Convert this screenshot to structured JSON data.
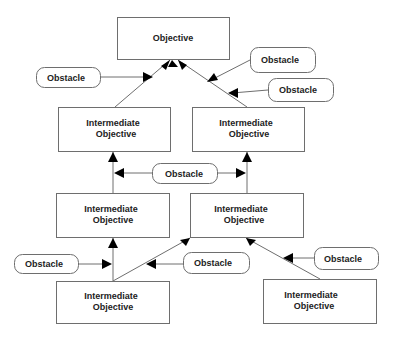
{
  "diagram": {
    "type": "objective-obstacle-tree",
    "colors": {
      "stroke": "#6e6e6e",
      "arrow": "#000000",
      "text": "#222222",
      "background": "#ffffff"
    },
    "nodes": {
      "objective": {
        "label": "Objective"
      },
      "io_r1_left": {
        "line1": "Intermediate",
        "line2": "Objective"
      },
      "io_r1_right": {
        "line1": "Intermediate",
        "line2": "Objective"
      },
      "io_r2_left": {
        "line1": "Intermediate",
        "line2": "Objective"
      },
      "io_r2_right": {
        "line1": "Intermediate",
        "line2": "Objective"
      },
      "io_r3_left": {
        "line1": "Intermediate",
        "line2": "Objective"
      },
      "io_r3_right": {
        "line1": "Intermediate",
        "line2": "Objective"
      }
    },
    "obstacles": [
      {
        "id": "obs_top_left",
        "label": "Obstacle"
      },
      {
        "id": "obs_top_right_1",
        "label": "Obstacle"
      },
      {
        "id": "obs_top_right_2",
        "label": "Obstacle"
      },
      {
        "id": "obs_middle",
        "label": "Obstacle"
      },
      {
        "id": "obs_bottom_left",
        "label": "Obstacle"
      },
      {
        "id": "obs_bottom_middle",
        "label": "Obstacle"
      },
      {
        "id": "obs_bottom_right",
        "label": "Obstacle"
      }
    ],
    "edges": [
      {
        "from": "io_r1_left",
        "to": "objective"
      },
      {
        "from": "io_r1_right",
        "to": "objective"
      },
      {
        "from": "io_r2_left",
        "to": "io_r1_left"
      },
      {
        "from": "io_r2_right",
        "to": "io_r1_right"
      },
      {
        "from": "io_r3_left",
        "to": "io_r2_left"
      },
      {
        "from": "io_r3_left",
        "to": "io_r2_right"
      },
      {
        "from": "io_r3_right",
        "to": "io_r2_right"
      },
      {
        "from": "obs_top_left",
        "to": "edge:io_r1_left->objective"
      },
      {
        "from": "obs_top_right_1",
        "to": "edge:io_r1_right->objective"
      },
      {
        "from": "obs_top_right_2",
        "to": "edge:io_r1_right->objective"
      },
      {
        "from": "obs_middle",
        "to": "edge:io_r2_left->io_r1_left"
      },
      {
        "from": "obs_middle",
        "to": "edge:io_r2_right->io_r1_right"
      },
      {
        "from": "obs_bottom_left",
        "to": "edge:io_r3_left->io_r2_left"
      },
      {
        "from": "obs_bottom_middle",
        "to": "edge:io_r3_left->io_r2_right"
      },
      {
        "from": "obs_bottom_right",
        "to": "edge:io_r3_right->io_r2_right"
      }
    ]
  }
}
